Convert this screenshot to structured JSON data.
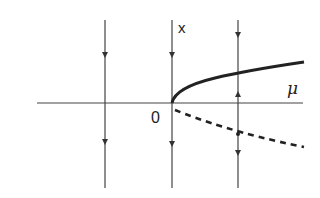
{
  "diagram": {
    "type": "bifurcation-diagram",
    "labels": {
      "vertical_axis": "x",
      "horizontal_axis": "μ",
      "origin": "0"
    },
    "branches": [
      {
        "name": "stable-branch",
        "style": "solid",
        "shape": "x = +sqrt(mu)"
      },
      {
        "name": "unstable-branch",
        "style": "dashed",
        "shape": "x = -sqrt(mu) (shallow)"
      }
    ],
    "flow_lines": [
      {
        "position": "mu<0",
        "arrows": [
          "down",
          "down"
        ]
      },
      {
        "position": "mu=0",
        "arrows": [
          "down",
          "down"
        ]
      },
      {
        "position": "mu>0",
        "arrows": [
          "down",
          "up",
          "down"
        ]
      }
    ],
    "colors": {
      "line": "#333333",
      "curve": "#222222",
      "background": "#ffffff"
    }
  }
}
